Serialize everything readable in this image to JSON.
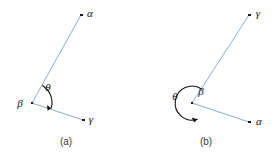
{
  "figure": {
    "background_color": "#ffffff",
    "ray_color": "#7BA7CC",
    "point_color": "#1a1a1a",
    "arc_color": "#111111",
    "label_color": "#111111",
    "caption_color": "#3a3a3a",
    "width": 279,
    "height": 160
  },
  "panels": [
    {
      "id": "panel-a",
      "caption": "(a)",
      "caption_x": 66,
      "caption_y": 142,
      "vertex": {
        "name": "beta",
        "label": "β",
        "x": 32,
        "y": 103,
        "label_x": 20,
        "label_y": 104
      },
      "rays": [
        {
          "id": "ray-beta-alpha",
          "endpoint_name": "alpha",
          "endpoint_label": "α",
          "x1": 32,
          "y1": 103,
          "x2": 81,
          "y2": 15,
          "label_x": 90,
          "label_y": 14
        },
        {
          "id": "ray-beta-gamma",
          "endpoint_name": "gamma",
          "endpoint_label": "γ",
          "x1": 32,
          "y1": 103,
          "x2": 83,
          "y2": 120,
          "label_x": 91,
          "label_y": 120
        }
      ],
      "angle": {
        "id": "angle-theta-a",
        "label": "θ",
        "label_x": 48,
        "label_y": 88,
        "type": "acute",
        "radius": 20,
        "sweep_degrees": 79,
        "arrow_at": "end"
      }
    },
    {
      "id": "panel-b",
      "caption": "(b)",
      "caption_x": 206,
      "caption_y": 142,
      "vertex": {
        "name": "beta",
        "label": "β",
        "x": 192,
        "y": 103,
        "label_x": 201,
        "label_y": 92
      },
      "rays": [
        {
          "id": "ray-beta-gamma",
          "endpoint_name": "gamma",
          "endpoint_label": "γ",
          "x1": 192,
          "y1": 103,
          "x2": 249,
          "y2": 15,
          "label_x": 258,
          "label_y": 14
        },
        {
          "id": "ray-beta-alpha",
          "endpoint_name": "alpha",
          "endpoint_label": "α",
          "x1": 192,
          "y1": 103,
          "x2": 249,
          "y2": 122,
          "label_x": 259,
          "label_y": 122
        }
      ],
      "angle": {
        "id": "angle-theta-b",
        "label": "θ",
        "label_x": 175,
        "label_y": 97,
        "type": "reflex",
        "radius": 17,
        "sweep_degrees": 281,
        "arrow_at": "end"
      }
    }
  ]
}
